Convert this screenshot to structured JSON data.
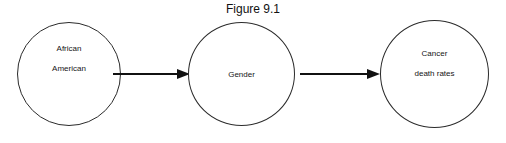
{
  "figure": {
    "title": "Figure 9.1",
    "type": "path-diagram",
    "background_color": "#ffffff",
    "stroke_color": "#2b2b2b",
    "text_color": "#151515"
  },
  "nodes": [
    {
      "id": "african-american",
      "label_line1": "African",
      "label_line2": "American",
      "shape": "circle"
    },
    {
      "id": "gender",
      "label_line1": "Gender",
      "label_line2": "",
      "shape": "circle"
    },
    {
      "id": "cancer-death-rates",
      "label_line1": "Cancer",
      "label_line2": "death rates",
      "shape": "circle"
    }
  ],
  "arrows": [
    {
      "id": "aa-to-gender",
      "from": "african-american",
      "to": "gender",
      "direction": "right",
      "label": ""
    },
    {
      "id": "gender-to-cancer",
      "from": "gender",
      "to": "cancer-death-rates",
      "direction": "right",
      "label": ""
    }
  ]
}
